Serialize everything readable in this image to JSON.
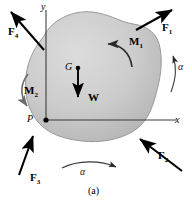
{
  "figure": {
    "caption": "(a)",
    "body_fill": "#c9c9c9",
    "body_stroke": "#8f8f8f",
    "line_color": "#1a1a1a",
    "axis_color": "#3c3c3c",
    "background": "#ffffff"
  },
  "axes": {
    "x_label": "x",
    "y_label": "y",
    "origin_label": "P"
  },
  "center_of_gravity": {
    "point_label": "G",
    "weight_label": "W"
  },
  "forces": [
    {
      "name": "F1",
      "label": "F",
      "sub": "1",
      "direction": "up-right"
    },
    {
      "name": "F2",
      "label": "F",
      "sub": "2",
      "direction": "up-left"
    },
    {
      "name": "F3",
      "label": "F",
      "sub": "3",
      "direction": "up-right"
    },
    {
      "name": "F4",
      "label": "F",
      "sub": "4",
      "direction": "up-left"
    }
  ],
  "moments": [
    {
      "name": "M1",
      "label": "M",
      "sub": "1",
      "sense": "counterclockwise"
    },
    {
      "name": "M2",
      "label": "M",
      "sub": "2",
      "sense": "clockwise"
    }
  ],
  "angular_accelerations": [
    {
      "name": "alpha-right",
      "label": "α",
      "position": "right"
    },
    {
      "name": "alpha-bottom",
      "label": "α",
      "position": "bottom"
    }
  ]
}
